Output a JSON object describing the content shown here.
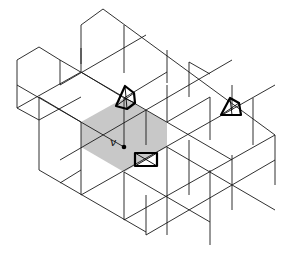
{
  "diagram": {
    "type": "hexagonal lattice tiling",
    "colors": {
      "line": "#1a1a1a",
      "shade": "#c8c8c8",
      "background": "#ffffff"
    },
    "vertex_label": "v",
    "shaded_region": "hexagon containing vertex v",
    "markers": [
      {
        "shape": "pentagon-with-triangle",
        "position": "upper-center"
      },
      {
        "shape": "triangle-in-quad",
        "position": "right"
      },
      {
        "shape": "rectangle-with-x",
        "position": "next to v"
      }
    ]
  }
}
